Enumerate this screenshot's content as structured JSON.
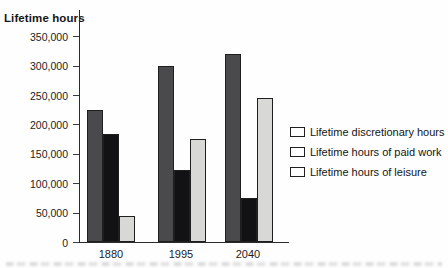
{
  "chart_data": {
    "type": "bar",
    "title": "Lifetime hours",
    "categories": [
      "1880",
      "1995",
      "2040"
    ],
    "series": [
      {
        "name": "Lifetime discretionary hours",
        "color": "#4a4a4d",
        "values": [
          225000,
          300000,
          320000
        ]
      },
      {
        "name": "Lifetime hours of paid work",
        "color": "#121214",
        "values": [
          183000,
          122000,
          75000
        ]
      },
      {
        "name": "Lifetime hours of leisure",
        "color": "#d8d8d6",
        "values": [
          45000,
          175000,
          245000
        ]
      }
    ],
    "ylim": [
      0,
      350000
    ],
    "ytick_step": 50000,
    "yticks": [
      "350,000",
      "300,000",
      "250,000",
      "200,000",
      "150,000",
      "100,000",
      "50,000",
      "0"
    ],
    "grid": false,
    "legend_position": "right",
    "bar_border_color": "#1f1f1f",
    "axis_color": "#2b2b2b"
  }
}
